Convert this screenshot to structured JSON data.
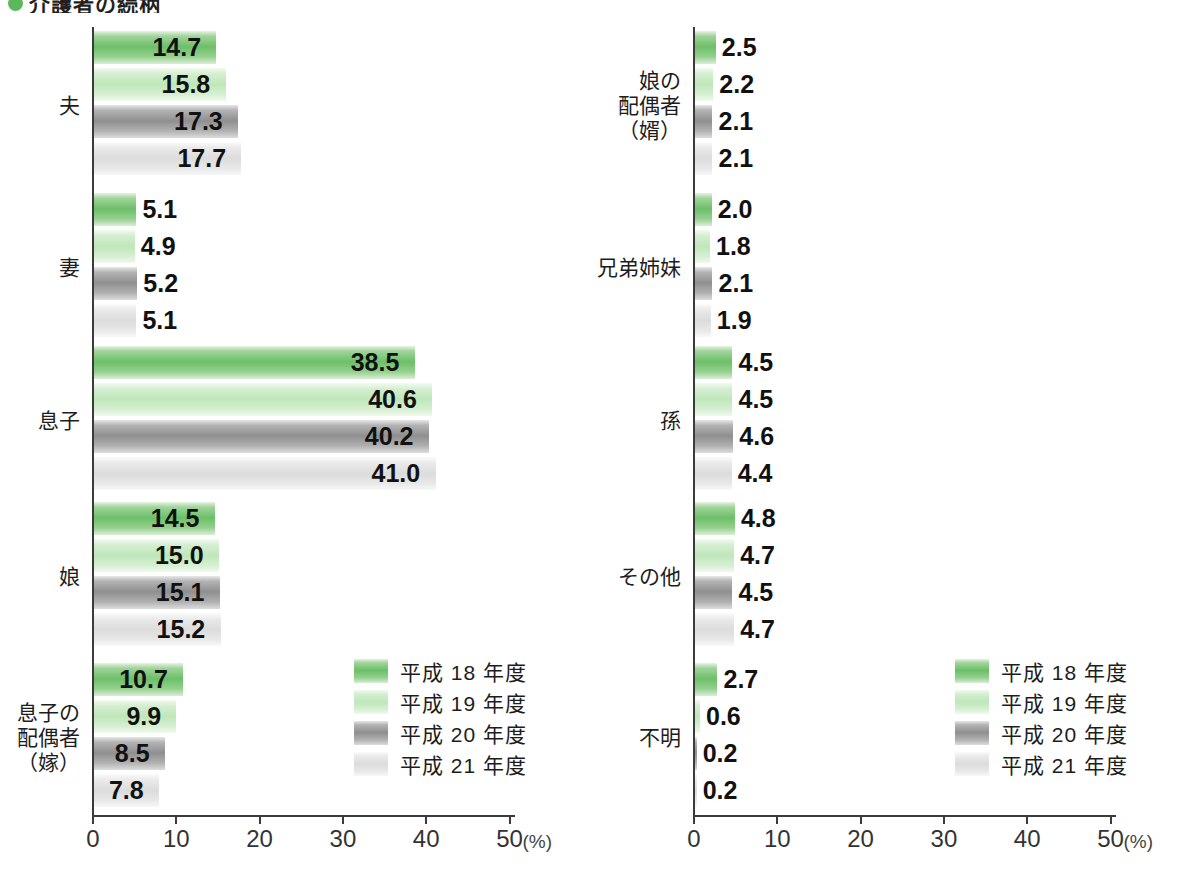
{
  "title": {
    "bullet_color": "#5cb85c",
    "text": "介護者の続柄"
  },
  "legend": {
    "items": [
      {
        "label": "平成 18 年度",
        "color": "#6cbf68"
      },
      {
        "label": "平成 19 年度",
        "color": "#bfe7ba"
      },
      {
        "label": "平成 20 年度",
        "color": "#8f8f8f"
      },
      {
        "label": "平成 21 年度",
        "color": "#dcdcdc"
      }
    ]
  },
  "axis": {
    "ticks": [
      "0",
      "10",
      "20",
      "30",
      "40",
      "50"
    ],
    "unit": "(%)",
    "min": 0,
    "max": 50
  },
  "chart_data": {
    "type": "bar",
    "orientation": "horizontal",
    "title": "介護者の続柄",
    "xlabel": "(%)",
    "ylabel": "",
    "xlim": [
      0,
      50
    ],
    "grid": false,
    "legend_position": "inside-lower-right",
    "series": [
      {
        "name": "平成 18 年度",
        "color": "#6cbf68"
      },
      {
        "name": "平成 19 年度",
        "color": "#bfe7ba"
      },
      {
        "name": "平成 20 年度",
        "color": "#8f8f8f"
      },
      {
        "name": "平成 21 年度",
        "color": "#dcdcdc"
      }
    ],
    "panels": [
      {
        "id": "left",
        "categories": [
          {
            "label": "夫",
            "values": [
              14.7,
              15.8,
              17.3,
              17.7
            ]
          },
          {
            "label": "妻",
            "values": [
              5.1,
              4.9,
              5.2,
              5.1
            ]
          },
          {
            "label": "息子",
            "values": [
              38.5,
              40.6,
              40.2,
              41.0
            ]
          },
          {
            "label": "娘",
            "values": [
              14.5,
              15.0,
              15.1,
              15.2
            ]
          },
          {
            "label": "息子の\n配偶者\n（嫁）",
            "values": [
              10.7,
              9.9,
              8.5,
              7.8
            ]
          }
        ]
      },
      {
        "id": "right",
        "categories": [
          {
            "label": "娘の\n配偶者\n（婿）",
            "values": [
              2.5,
              2.2,
              2.1,
              2.1
            ]
          },
          {
            "label": "兄弟姉妹",
            "values": [
              2.0,
              1.8,
              2.1,
              1.9
            ]
          },
          {
            "label": "孫",
            "values": [
              4.5,
              4.5,
              4.6,
              4.4
            ]
          },
          {
            "label": "その他",
            "values": [
              4.8,
              4.7,
              4.5,
              4.7
            ]
          },
          {
            "label": "不明",
            "values": [
              2.7,
              0.6,
              0.2,
              0.2
            ]
          }
        ]
      }
    ]
  }
}
